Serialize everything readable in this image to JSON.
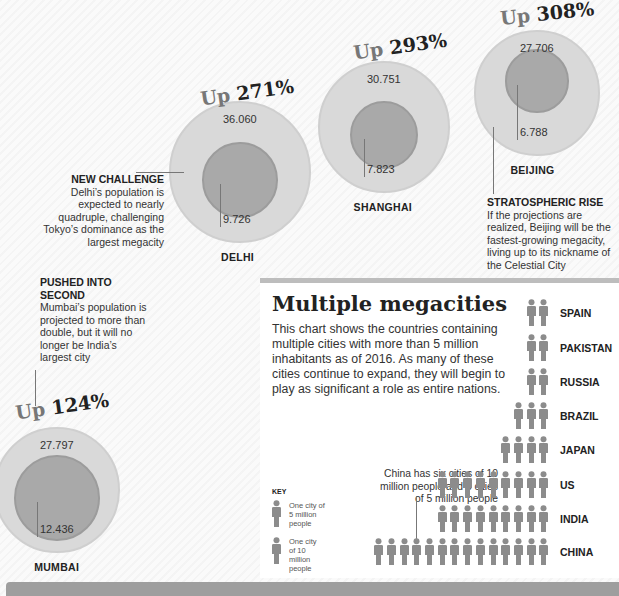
{
  "chart_data": [
    {
      "type": "bubble-comparison",
      "title": "Megacity population growth",
      "unit": "millions",
      "series": [
        {
          "city": "DELHI",
          "current": 9.726,
          "projected": 36.06,
          "growth_label": "271%"
        },
        {
          "city": "SHANGHAI",
          "current": 7.823,
          "projected": 30.751,
          "growth_label": "293%"
        },
        {
          "city": "BEIJING",
          "current": 6.788,
          "projected": 27.706,
          "growth_label": "308%"
        },
        {
          "city": "CAIRO",
          "current": 9.892,
          "projected": 24.502,
          "growth_label": "148%"
        },
        {
          "city": "MUMBAI",
          "current": 12.436,
          "projected": 27.797,
          "growth_label": "124%"
        }
      ],
      "up_word": "Up"
    },
    {
      "type": "pictogram",
      "title": "Multiple megacities",
      "description": "This chart shows the countries containing multiple cities with more than 5 million inhabitants as of 2016. As many of these cities continue to expand, they will begin to play as significant a role as entire nations.",
      "categories": [
        "SPAIN",
        "PAKISTAN",
        "RUSSIA",
        "BRAZIL",
        "JAPAN",
        "US",
        "INDIA",
        "CHINA"
      ],
      "values": [
        2,
        2,
        2,
        3,
        4,
        9,
        9,
        14
      ],
      "value_label": "Number of cities with more than 5 million people",
      "key": {
        "title": "KEY",
        "items": [
          {
            "label": "One city of 5 million people",
            "size": "small"
          },
          {
            "label": "One city of 10 million people",
            "size": "large"
          }
        ]
      },
      "annotation": "China has six cities of 10 million people and 8 cities of 5 million people"
    }
  ],
  "notes": {
    "delhi": {
      "title": "NEW CHALLENGE",
      "text": "Delhi’s population is expected to nearly quadruple, challenging Tokyo’s dominance as the largest megacity"
    },
    "beijing": {
      "title": "STRATOSPHERIC RISE",
      "text": "If the projections are realized, Beijing will be the fastest-growing megacity, living up to its nickname of the Celestial City"
    },
    "mumbai": {
      "title": "PUSHED INTO SECOND",
      "text": "Mumbai’s population is projected to more than double, but it will no longer be India’s largest city"
    }
  },
  "colors": {
    "outer": "#d9d9d9",
    "inner": "#a9a9a9",
    "figure": "#8c8c8c",
    "accent_bar": "#9e9e9e"
  }
}
